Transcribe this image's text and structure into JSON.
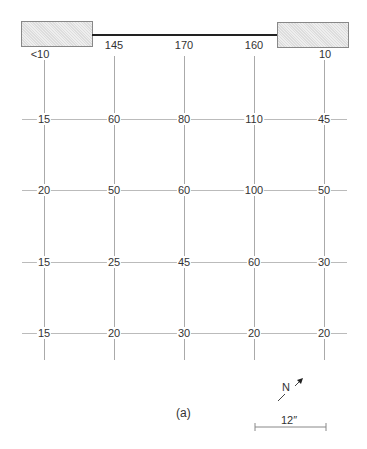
{
  "diagram": {
    "top_labels": [
      "<10",
      "145",
      "170",
      "160",
      "10"
    ],
    "rows": [
      [
        "15",
        "60",
        "80",
        "110",
        "45"
      ],
      [
        "20",
        "50",
        "60",
        "100",
        "50"
      ],
      [
        "15",
        "25",
        "45",
        "60",
        "30"
      ],
      [
        "15",
        "20",
        "30",
        "20",
        "20"
      ]
    ],
    "caption": "(a)",
    "north_label": "N",
    "scale_label": "12″"
  }
}
